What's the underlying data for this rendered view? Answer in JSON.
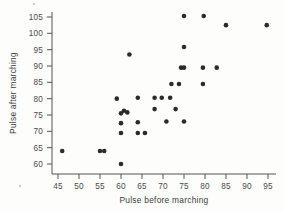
{
  "chart_data": {
    "type": "scatter",
    "title": "",
    "xlabel": "Pulse before marching",
    "ylabel": "Pulse after marching",
    "xlim": [
      43,
      97
    ],
    "ylim": [
      58,
      107
    ],
    "xticks": [
      45,
      50,
      55,
      60,
      65,
      70,
      75,
      80,
      85,
      90,
      95
    ],
    "yticks": [
      60,
      65,
      70,
      75,
      80,
      85,
      90,
      95,
      100,
      105
    ],
    "grid": false,
    "legend": null,
    "marker_color": "#2b2b2b",
    "points": [
      [
        46,
        64
      ],
      [
        55,
        64
      ],
      [
        56,
        64
      ],
      [
        59,
        80
      ],
      [
        60,
        60
      ],
      [
        60,
        69.5
      ],
      [
        60,
        72.5
      ],
      [
        60,
        75.5
      ],
      [
        60.7,
        76.3
      ],
      [
        61.5,
        75.8
      ],
      [
        62,
        93.5
      ],
      [
        64,
        69.5
      ],
      [
        64,
        72.8
      ],
      [
        64,
        80.3
      ],
      [
        65.7,
        69.5
      ],
      [
        68,
        76.8
      ],
      [
        68,
        80.3
      ],
      [
        69.7,
        80.3
      ],
      [
        70.8,
        73
      ],
      [
        71.7,
        80.3
      ],
      [
        72,
        84.5
      ],
      [
        73,
        76.8
      ],
      [
        73.8,
        84.5
      ],
      [
        74.3,
        89.5
      ],
      [
        75,
        89.5
      ],
      [
        75,
        95.8
      ],
      [
        75,
        105.3
      ],
      [
        75,
        73
      ],
      [
        79.5,
        84.5
      ],
      [
        79.5,
        89.5
      ],
      [
        79.7,
        105.3
      ],
      [
        82.8,
        89.5
      ],
      [
        85,
        102.5
      ],
      [
        94.7,
        102.5
      ]
    ]
  },
  "axes": {
    "x_axis_name": "x-axis",
    "y_axis_name": "y-axis"
  }
}
